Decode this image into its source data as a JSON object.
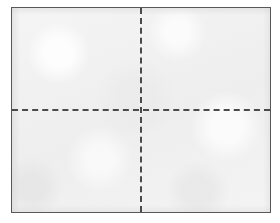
{
  "figure": {
    "kind": "quadrant-diagram",
    "width": 280,
    "height": 223,
    "canvas_color": "#ffffff",
    "has_text": false,
    "caption": "",
    "title": ""
  },
  "panel": {
    "name": "bordered-rectangle",
    "fill_color": "#efefef",
    "border_color": "#585858",
    "border_width_px": 1,
    "left_px": 11,
    "top_px": 7,
    "width_px": 260,
    "height_px": 206,
    "texture": "scanned-paper-mottle"
  },
  "dividers": {
    "horizontal": {
      "name": "horizontal-dashed-line",
      "orientation": "horizontal",
      "style": "dashed",
      "color": "#4a4a4a",
      "thickness_px": 2,
      "dash_length_px": 7,
      "gap_length_px": 4,
      "position_y_px": 110,
      "position_fraction": 0.5,
      "spans": "full-width"
    },
    "vertical": {
      "name": "vertical-dashed-line",
      "orientation": "vertical",
      "style": "dashed",
      "color": "#4a4a4a",
      "thickness_px": 2,
      "dash_length_px": 6,
      "gap_length_px": 4,
      "position_x_px": 141,
      "position_fraction": 0.5,
      "spans": "full-height"
    },
    "intersection": {
      "x_px": 141,
      "y_px": 110
    }
  },
  "quadrants": [
    {
      "name": "quadrant-top-left",
      "label": ""
    },
    {
      "name": "quadrant-top-right",
      "label": ""
    },
    {
      "name": "quadrant-bottom-left",
      "label": ""
    },
    {
      "name": "quadrant-bottom-right",
      "label": ""
    }
  ]
}
